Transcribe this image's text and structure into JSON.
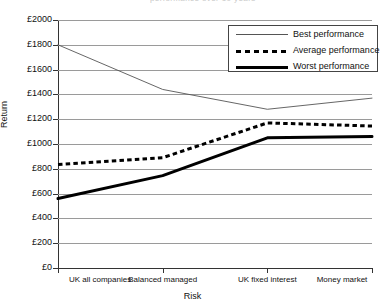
{
  "title_sliver": "performance over 10 years",
  "axis": {
    "y_label": "Return",
    "x_label": "Risk",
    "y_ticks": [
      "£2000",
      "£1800",
      "£1600",
      "£1400",
      "£1200",
      "£1000",
      "£800",
      "£600",
      "£400",
      "£200",
      "£0"
    ]
  },
  "legend": {
    "items": [
      {
        "label": "Best performance",
        "style": "thin-solid"
      },
      {
        "label": "Average performance",
        "style": "thick-dashed"
      },
      {
        "label": "Worst performance",
        "style": "thick-solid"
      }
    ]
  },
  "chart_data": {
    "type": "line",
    "title": "performance over 10 years",
    "xlabel": "Risk",
    "ylabel": "Return",
    "ylim": [
      0,
      2000
    ],
    "ytick_step": 200,
    "grid": true,
    "legend_position": "top-right",
    "currency": "£",
    "categories": [
      "UK all companies",
      "Balanced managed",
      "UK fixed interest",
      "Money market"
    ],
    "series": [
      {
        "name": "Best performance",
        "values": [
          1800,
          1440,
          1280,
          1370
        ],
        "style": "thin-solid",
        "color": "#555555"
      },
      {
        "name": "Average performance",
        "values": [
          835,
          890,
          1170,
          1145
        ],
        "style": "thick-dashed",
        "color": "#000000"
      },
      {
        "name": "Worst performance",
        "values": [
          560,
          745,
          1050,
          1060
        ],
        "style": "thick-solid",
        "color": "#000000"
      }
    ]
  }
}
